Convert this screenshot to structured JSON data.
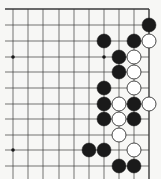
{
  "board": {
    "description": "Partial Go board (top-right corner region)",
    "columns": 10,
    "rows": 11,
    "col_x": [
      13,
      28,
      43,
      59,
      74,
      89,
      104,
      119,
      134,
      149
    ],
    "row_y": [
      9,
      25,
      41,
      57,
      72,
      88,
      104,
      119,
      135,
      150,
      166
    ],
    "edges": {
      "top": true,
      "right": true,
      "left": false,
      "bottom": false
    },
    "line_color": "#3a3a3a",
    "black_color": "#1a1a1a",
    "white_fill": "#ffffff",
    "white_stroke": "#333333",
    "star_points": [
      {
        "col": 0,
        "row": 3
      },
      {
        "col": 6,
        "row": 3
      },
      {
        "col": 0,
        "row": 9
      }
    ],
    "stones": [
      {
        "col": 9,
        "row": 1,
        "color": "black"
      },
      {
        "col": 6,
        "row": 2,
        "color": "black"
      },
      {
        "col": 8,
        "row": 2,
        "color": "black"
      },
      {
        "col": 9,
        "row": 2,
        "color": "white"
      },
      {
        "col": 7,
        "row": 3,
        "color": "black"
      },
      {
        "col": 8,
        "row": 3,
        "color": "white"
      },
      {
        "col": 7,
        "row": 4,
        "color": "black"
      },
      {
        "col": 8,
        "row": 4,
        "color": "white"
      },
      {
        "col": 6,
        "row": 5,
        "color": "black"
      },
      {
        "col": 8,
        "row": 5,
        "color": "white"
      },
      {
        "col": 6,
        "row": 6,
        "color": "black"
      },
      {
        "col": 7,
        "row": 6,
        "color": "white"
      },
      {
        "col": 8,
        "row": 6,
        "color": "black"
      },
      {
        "col": 9,
        "row": 6,
        "color": "white"
      },
      {
        "col": 6,
        "row": 7,
        "color": "black"
      },
      {
        "col": 7,
        "row": 7,
        "color": "white"
      },
      {
        "col": 8,
        "row": 7,
        "color": "black"
      },
      {
        "col": 7,
        "row": 8,
        "color": "white"
      },
      {
        "col": 5,
        "row": 9,
        "color": "black"
      },
      {
        "col": 6,
        "row": 9,
        "color": "black"
      },
      {
        "col": 8,
        "row": 9,
        "color": "white"
      },
      {
        "col": 7,
        "row": 10,
        "color": "black"
      },
      {
        "col": 8,
        "row": 10,
        "color": "black"
      }
    ]
  }
}
